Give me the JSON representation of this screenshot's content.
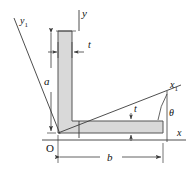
{
  "figure": {
    "kind": "engineering-cross-section-diagram",
    "colors": {
      "section_fill": "#d9d9d9",
      "section_stroke": "#555555",
      "axis_stroke": "#3a3a3a",
      "dimension_stroke": "#3a3a3a",
      "background": "#ffffff",
      "text": "#111111"
    },
    "labels": {
      "y_axis": "y",
      "x_axis": "x",
      "y1_axis": "y",
      "y1_sub": "1",
      "x1_axis": "x",
      "x1_sub": "1",
      "origin": "O",
      "height_a": "a",
      "width_b": "b",
      "thickness_vertical": "t",
      "thickness_horizontal": "t",
      "angle_theta": "θ"
    },
    "dimensions": {
      "a_meaning": "overall height of vertical leg",
      "b_meaning": "overall width of horizontal leg",
      "t_meaning": "leg thickness",
      "theta_meaning": "rotation angle of x1 axis above x axis"
    }
  }
}
